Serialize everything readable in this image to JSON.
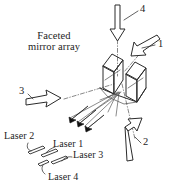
{
  "figure": {
    "title_line1": "Faceted",
    "title_line2": "mirror array",
    "beam_numbers": {
      "one": "1",
      "two": "2",
      "three": "3",
      "four": "4"
    },
    "laser_labels": {
      "laser1": "Laser 1",
      "laser2": "Laser 2",
      "laser3": "Laser 3",
      "laser4": "Laser 4"
    },
    "colors": {
      "ink": "#2b2b2b",
      "ray": "#555555",
      "solid_beam": "#111111",
      "background": "#ffffff"
    }
  }
}
